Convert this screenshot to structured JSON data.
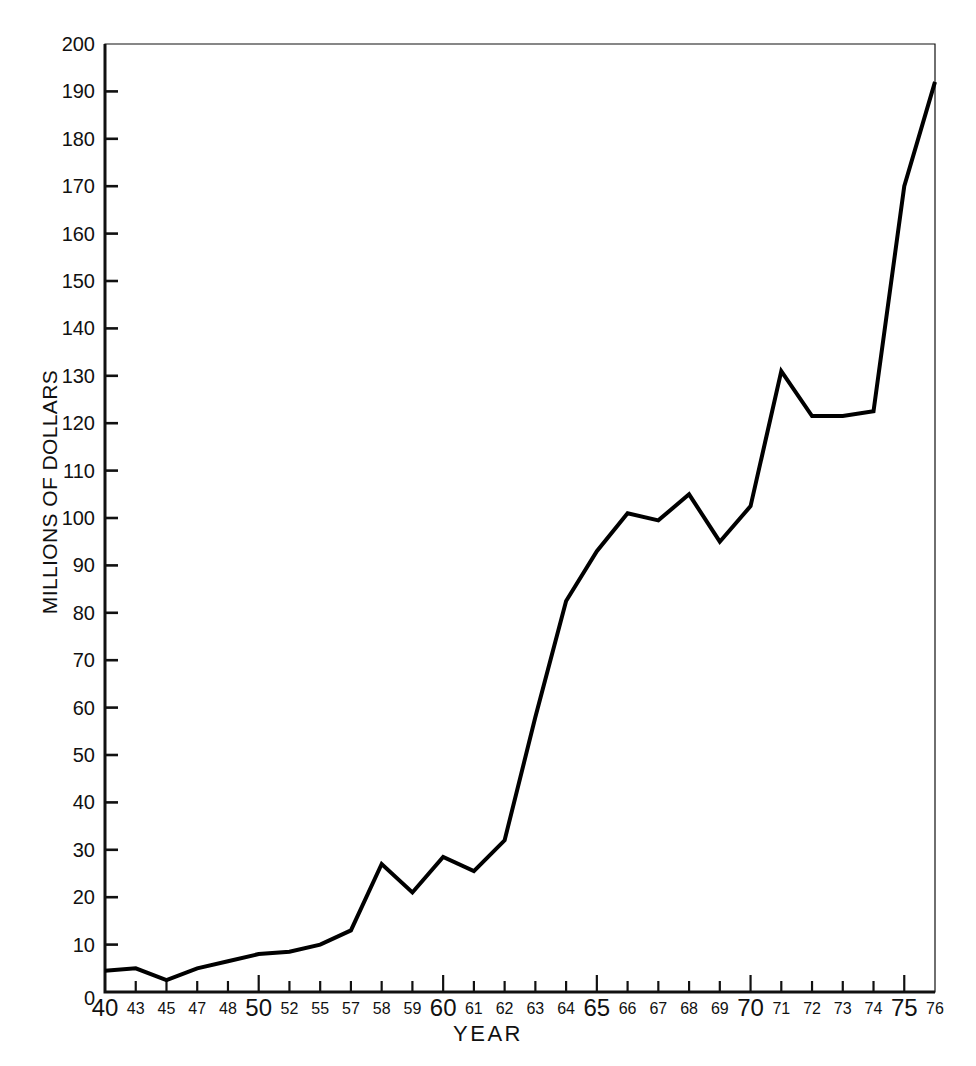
{
  "chart_data": {
    "type": "line",
    "title": "",
    "xlabel": "YEAR",
    "ylabel": "MILLIONS OF DOLLARS",
    "ylim": [
      0,
      200
    ],
    "ytick_step": 10,
    "yticks": [
      0,
      10,
      20,
      30,
      40,
      50,
      60,
      70,
      80,
      90,
      100,
      110,
      120,
      130,
      140,
      150,
      160,
      170,
      180,
      190,
      200
    ],
    "grid": false,
    "legend": "none",
    "line_color": "#000000",
    "categories": [
      "40",
      "43",
      "45",
      "47",
      "48",
      "50",
      "52",
      "55",
      "57",
      "58",
      "59",
      "60",
      "61",
      "62",
      "63",
      "64",
      "65",
      "66",
      "67",
      "68",
      "69",
      "70",
      "71",
      "72",
      "73",
      "74",
      "75",
      "76"
    ],
    "emphasized_categories": [
      "40",
      "50",
      "60",
      "65",
      "70",
      "75"
    ],
    "values": [
      4.5,
      5.0,
      2.5,
      5.0,
      6.5,
      8.0,
      8.5,
      10.0,
      13.0,
      27.0,
      21.0,
      28.5,
      25.5,
      32.0,
      58.0,
      82.5,
      93.0,
      101.0,
      99.5,
      105.0,
      95.0,
      102.5,
      131.0,
      121.5,
      121.5,
      122.5,
      170.0,
      192.0
    ],
    "series": [
      {
        "name": "Millions of dollars",
        "values": [
          4.5,
          5.0,
          2.5,
          5.0,
          6.5,
          8.0,
          8.5,
          10.0,
          13.0,
          27.0,
          21.0,
          28.5,
          25.5,
          32.0,
          58.0,
          82.5,
          93.0,
          101.0,
          99.5,
          105.0,
          95.0,
          102.5,
          131.0,
          121.5,
          121.5,
          122.5,
          170.0,
          192.0
        ]
      }
    ]
  },
  "axes": {
    "y_axis_title": "MILLIONS OF DOLLARS",
    "x_axis_title": "YEAR"
  }
}
